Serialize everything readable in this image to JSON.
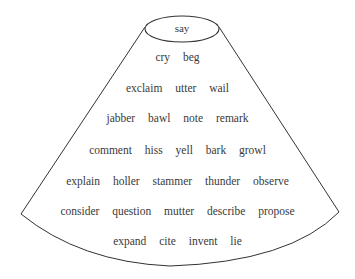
{
  "diagram": {
    "type": "cone-hierarchy",
    "top": "say",
    "rows": [
      [
        "cry",
        "beg"
      ],
      [
        "exclaim",
        "utter",
        "wail"
      ],
      [
        "jabber",
        "bawl",
        "note",
        "remark"
      ],
      [
        "comment",
        "hiss",
        "yell",
        "bark",
        "growl"
      ],
      [
        "explain",
        "holler",
        "stammer",
        "thunder",
        "observe"
      ],
      [
        "consider",
        "question",
        "mutter",
        "describe",
        "propose"
      ],
      [
        "expand",
        "cite",
        "invent",
        "lie"
      ]
    ],
    "stroke_color": "#333333",
    "text_color": "#3a3a3a"
  }
}
